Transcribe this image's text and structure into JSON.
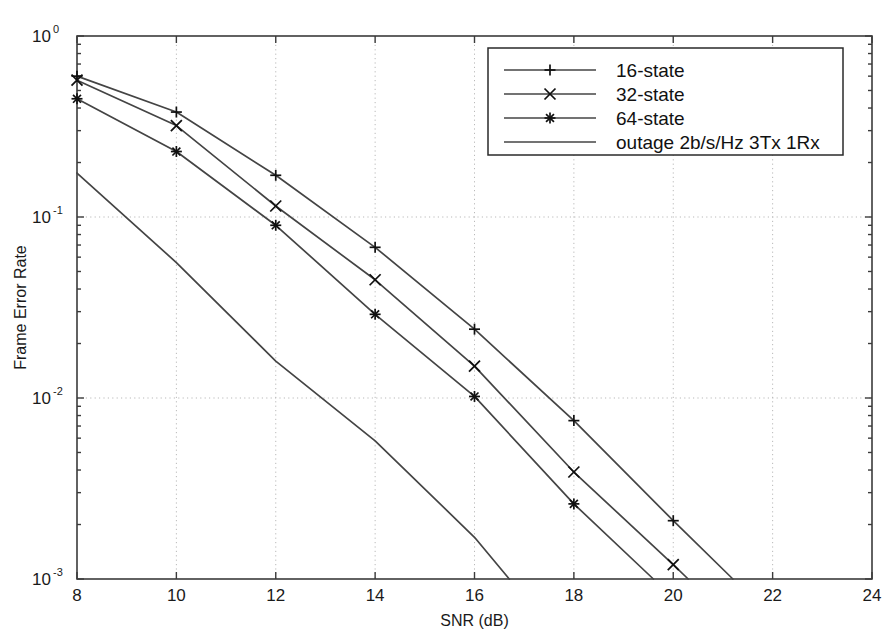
{
  "figure": {
    "background_color": "#ffffff",
    "axis_color": "#3b3b3b",
    "grid_color": "#b9b9b9",
    "series_color": "#444444"
  },
  "chart_data": {
    "type": "line",
    "title": "",
    "xlabel": "SNR (dB)",
    "ylabel": "Frame Error Rate",
    "xlim": [
      8,
      24
    ],
    "ylim": [
      0.001,
      1
    ],
    "yscale": "log",
    "xscale": "linear",
    "grid": true,
    "xticks": [
      8,
      10,
      12,
      14,
      16,
      18,
      20,
      22,
      24
    ],
    "xtick_labels": [
      "8",
      "10",
      "12",
      "14",
      "16",
      "18",
      "20",
      "22",
      "24"
    ],
    "yticks": [
      1,
      0.1,
      0.01,
      0.001
    ],
    "ytick_labels": [
      "10",
      "10",
      "10",
      "10"
    ],
    "ytick_exponents": [
      "0",
      "-1",
      "-2",
      "-3"
    ],
    "legend_position": "upper right",
    "series": [
      {
        "name": "16-state",
        "marker": "plus",
        "x": [
          8,
          10,
          12,
          14,
          16,
          18,
          20,
          21.2
        ],
        "values": [
          0.6,
          0.38,
          0.17,
          0.068,
          0.024,
          0.0075,
          0.0021,
          0.001
        ]
      },
      {
        "name": "32-state",
        "marker": "cross",
        "x": [
          8,
          10,
          12,
          14,
          16,
          18,
          20,
          20.3
        ],
        "values": [
          0.57,
          0.32,
          0.115,
          0.045,
          0.015,
          0.0039,
          0.0012,
          0.001
        ]
      },
      {
        "name": "64-state",
        "marker": "asterisk",
        "x": [
          8,
          10,
          12,
          14,
          16,
          18,
          19.6
        ],
        "values": [
          0.45,
          0.23,
          0.09,
          0.029,
          0.0102,
          0.0026,
          0.001
        ]
      },
      {
        "name": "outage 2b/s/Hz 3Tx 1Rx",
        "marker": "none",
        "x": [
          8,
          10,
          12,
          14,
          16,
          16.7
        ],
        "values": [
          0.175,
          0.056,
          0.016,
          0.0058,
          0.0017,
          0.001
        ]
      }
    ]
  },
  "legend": {
    "entries": [
      {
        "label": "16-state",
        "marker": "plus"
      },
      {
        "label": "32-state",
        "marker": "cross"
      },
      {
        "label": "64-state",
        "marker": "asterisk"
      },
      {
        "label": "outage 2b/s/Hz 3Tx 1Rx",
        "marker": "none"
      }
    ]
  }
}
